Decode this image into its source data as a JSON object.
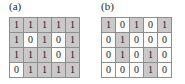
{
  "figure": {
    "panels": [
      {
        "label": "(a)",
        "name": "panel-a",
        "rows": [
          [
            "1",
            "1",
            "1",
            "1",
            "1"
          ],
          [
            "1",
            "0",
            "1",
            "0",
            "1"
          ],
          [
            "1",
            "1",
            "1",
            "0",
            "1"
          ],
          [
            "0",
            "1",
            "1",
            "1",
            "1"
          ]
        ]
      },
      {
        "label": "(b)",
        "name": "panel-b",
        "rows": [
          [
            "1",
            "0",
            "1",
            "0",
            "1"
          ],
          [
            "0",
            "1",
            "0",
            "0",
            "0"
          ],
          [
            "0",
            "1",
            "0",
            "1",
            "0"
          ],
          [
            "0",
            "0",
            "0",
            "1",
            "0"
          ]
        ]
      }
    ],
    "colors": {
      "cell_on_fill": "#c9c9c9",
      "cell_off_fill": "#fdfdfd",
      "cell_border": "#8d8d8d",
      "text": "#1c1c1c",
      "background": "#ffffff"
    },
    "shading_rule_value": "1"
  }
}
